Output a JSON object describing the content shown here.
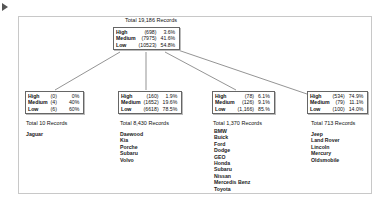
{
  "root": {
    "total": "Total 19,186 Records",
    "rows": [
      {
        "label": "High",
        "count": "(698)",
        "pct": "3.6%"
      },
      {
        "label": "Medium",
        "count": "(7975)",
        "pct": "41.6%"
      },
      {
        "label": "Low",
        "count": "(10523)",
        "pct": "54.8%"
      }
    ]
  },
  "children": [
    {
      "total": "Total 10 Records",
      "rows": [
        {
          "label": "High",
          "count": "(0)",
          "pct": "0%"
        },
        {
          "label": "Medium",
          "count": "(4)",
          "pct": "40%"
        },
        {
          "label": "Low",
          "count": "(6)",
          "pct": "60%"
        }
      ],
      "items": [
        "Jaguar"
      ]
    },
    {
      "total": "Total 8,430 Records",
      "rows": [
        {
          "label": "High",
          "count": "(160)",
          "pct": "1.9%"
        },
        {
          "label": "Medium",
          "count": "(1652)",
          "pct": "19.6%"
        },
        {
          "label": "Low",
          "count": "(6618)",
          "pct": "78.5%"
        }
      ],
      "items": [
        "Daewood",
        "Kia",
        "Porche",
        "Subaru",
        "Volvo"
      ]
    },
    {
      "total": "Total 1,370 Records",
      "rows": [
        {
          "label": "High",
          "count": "(78)",
          "pct": "6.1%"
        },
        {
          "label": "Medium",
          "count": "(126)",
          "pct": "9.1%"
        },
        {
          "label": "Low",
          "count": "(1,166)",
          "pct": "85.%"
        }
      ],
      "items": [
        "BMW",
        "Buick",
        "Ford",
        "Dodge",
        "GEO",
        "Honda",
        "Subaru",
        "Nissan",
        "Mercedis Benz",
        "Toyota"
      ]
    },
    {
      "total": "Total 713 Records",
      "rows": [
        {
          "label": "High",
          "count": "(534)",
          "pct": "74.9%"
        },
        {
          "label": "Medium",
          "count": "(79)",
          "pct": "11.1%"
        },
        {
          "label": "Low",
          "count": "(100)",
          "pct": "14.0%"
        }
      ],
      "items": [
        "Jeep",
        "Land Rover",
        "Lincoln",
        "Mercury",
        "Oldsmobile"
      ]
    }
  ]
}
